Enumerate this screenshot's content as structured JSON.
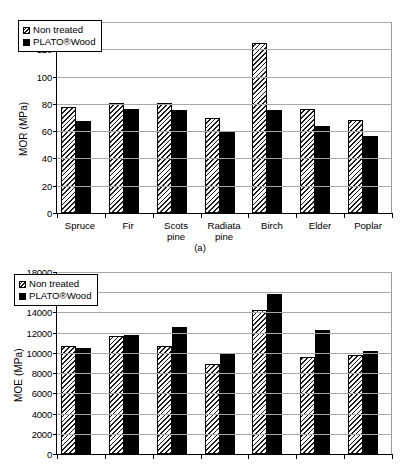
{
  "figure": {
    "captions": {
      "a": "(a)"
    },
    "legend": {
      "non_treated": "Non treated",
      "plato": "PLATO®Wood"
    }
  },
  "chart_data": [
    {
      "id": "a",
      "type": "bar",
      "title": "",
      "xlabel": "",
      "ylabel": "MOR (MPa)",
      "ylim": [
        0,
        140
      ],
      "ytick_step": 20,
      "yticks": [
        "0",
        "20",
        "40",
        "60",
        "80",
        "100",
        "120",
        "140"
      ],
      "grid": true,
      "legend_position": "top-left",
      "categories": [
        "Spruce",
        "Fir",
        "Scots pine",
        "Radiata pine",
        "Birch",
        "Elder",
        "Poplar"
      ],
      "category_lines": [
        [
          "Spruce"
        ],
        [
          "Fir"
        ],
        [
          "Scots",
          "pine"
        ],
        [
          "Radiata",
          "pine"
        ],
        [
          "Birch"
        ],
        [
          "Elder"
        ],
        [
          "Poplar"
        ]
      ],
      "series": [
        {
          "name": "Non treated",
          "style": "hatch",
          "values": [
            78,
            81,
            80.5,
            69.5,
            124.5,
            76.5,
            68
          ]
        },
        {
          "name": "PLATO®Wood",
          "style": "solid",
          "values": [
            67.5,
            76.5,
            75.5,
            59.5,
            75.5,
            63.5,
            56.5
          ]
        }
      ],
      "caption": "(a)"
    },
    {
      "id": "b",
      "type": "bar",
      "title": "",
      "xlabel": "",
      "ylabel": "MOE (MPa)",
      "ylim": [
        0,
        18000
      ],
      "ytick_step": 2000,
      "yticks": [
        "0",
        "2000",
        "4000",
        "6000",
        "8000",
        "10000",
        "12000",
        "14000",
        "16000",
        "18000"
      ],
      "grid": true,
      "legend_position": "top-left",
      "categories": [
        "Spruce",
        "Fir",
        "Scots pine",
        "Radiata pine",
        "Birch",
        "Elder",
        "Poplar"
      ],
      "category_lines": [
        [],
        [],
        [],
        [],
        [],
        [],
        []
      ],
      "series": [
        {
          "name": "Non treated",
          "style": "hatch",
          "values": [
            10650,
            11650,
            10650,
            8900,
            14200,
            9600,
            9800
          ]
        },
        {
          "name": "PLATO®Wood",
          "style": "solid",
          "values": [
            10450,
            11800,
            12600,
            9850,
            15800,
            12250,
            10150
          ]
        }
      ],
      "caption": ""
    }
  ]
}
